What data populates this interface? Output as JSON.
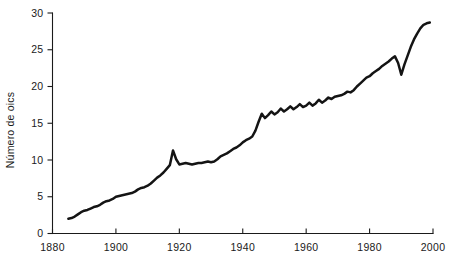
{
  "chart_data": {
    "type": "line",
    "title": "",
    "subtitle": "",
    "xlabel": "",
    "ylabel": "Número de oics",
    "xlim": [
      1880,
      2000
    ],
    "ylim": [
      0,
      30
    ],
    "grid": false,
    "legend": false,
    "legend_position": "none",
    "x_ticks": [
      1880,
      1900,
      1920,
      1940,
      1960,
      1980,
      2000
    ],
    "x_tick_labels": [
      "1880",
      "1900",
      "1920",
      "1940",
      "1960",
      "1980",
      "2000"
    ],
    "y_ticks": [
      0,
      5,
      10,
      15,
      20,
      25,
      30
    ],
    "y_tick_labels": [
      "0",
      "5",
      "10",
      "15",
      "20",
      "25",
      "30"
    ],
    "series": [
      {
        "name": "Número de oics",
        "color": "#141414",
        "x": [
          1885,
          1886,
          1887,
          1888,
          1889,
          1890,
          1891,
          1892,
          1893,
          1894,
          1895,
          1896,
          1897,
          1898,
          1899,
          1900,
          1901,
          1902,
          1903,
          1904,
          1905,
          1906,
          1907,
          1908,
          1909,
          1910,
          1911,
          1912,
          1913,
          1914,
          1915,
          1916,
          1917,
          1918,
          1919,
          1920,
          1921,
          1922,
          1923,
          1924,
          1925,
          1926,
          1927,
          1928,
          1929,
          1930,
          1931,
          1932,
          1933,
          1934,
          1935,
          1936,
          1937,
          1938,
          1939,
          1940,
          1941,
          1942,
          1943,
          1944,
          1945,
          1946,
          1947,
          1948,
          1949,
          1950,
          1951,
          1952,
          1953,
          1954,
          1955,
          1956,
          1957,
          1958,
          1959,
          1960,
          1961,
          1962,
          1963,
          1964,
          1965,
          1966,
          1967,
          1968,
          1969,
          1970,
          1971,
          1972,
          1973,
          1974,
          1975,
          1976,
          1977,
          1978,
          1979,
          1980,
          1981,
          1982,
          1983,
          1984,
          1985,
          1986,
          1987,
          1988,
          1989,
          1990,
          1991,
          1992,
          1993,
          1994,
          1995,
          1996,
          1997,
          1998,
          1999
        ],
        "values": [
          2.0,
          2.1,
          2.3,
          2.6,
          2.9,
          3.1,
          3.2,
          3.4,
          3.6,
          3.7,
          3.9,
          4.2,
          4.4,
          4.5,
          4.7,
          5.0,
          5.1,
          5.2,
          5.3,
          5.4,
          5.5,
          5.7,
          6.0,
          6.2,
          6.3,
          6.5,
          6.8,
          7.2,
          7.6,
          7.9,
          8.3,
          8.8,
          9.3,
          11.3,
          10.1,
          9.4,
          9.5,
          9.6,
          9.5,
          9.4,
          9.5,
          9.6,
          9.6,
          9.7,
          9.8,
          9.7,
          9.8,
          10.1,
          10.5,
          10.7,
          10.9,
          11.2,
          11.5,
          11.7,
          12.0,
          12.4,
          12.7,
          12.9,
          13.2,
          14.0,
          15.2,
          16.3,
          15.7,
          16.1,
          16.6,
          16.2,
          16.5,
          17.0,
          16.6,
          16.9,
          17.3,
          16.9,
          17.2,
          17.6,
          17.2,
          17.4,
          17.8,
          17.4,
          17.7,
          18.2,
          17.8,
          18.1,
          18.5,
          18.3,
          18.6,
          18.7,
          18.8,
          19.0,
          19.3,
          19.2,
          19.5,
          20.0,
          20.4,
          20.8,
          21.2,
          21.4,
          21.8,
          22.1,
          22.4,
          22.8,
          23.1,
          23.4,
          23.8,
          24.1,
          23.2,
          21.6,
          23.0,
          24.2,
          25.4,
          26.4,
          27.2,
          27.9,
          28.4,
          28.6,
          28.7
        ]
      }
    ]
  }
}
